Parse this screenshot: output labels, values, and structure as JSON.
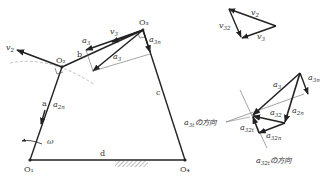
{
  "mechanism": {
    "points": {
      "O1": "O₁",
      "O2": "O₂",
      "O3": "O₃",
      "O4": "O₄"
    },
    "links": {
      "a": "a",
      "b": "b",
      "c": "c",
      "d": "d"
    },
    "angular_velocity": "ω",
    "vectors": {
      "v2": "v",
      "v2_sub": "2",
      "v3": "v",
      "v3_sub": "3",
      "a2n": "a",
      "a2n_sub": "2n",
      "a3": "a",
      "a3_sub": "3",
      "a3n": "a",
      "a3n_sub": "3n",
      "a1": "a",
      "a1_sub": "3"
    }
  },
  "velocity_polygon": {
    "v2": "v",
    "v2_sub": "2",
    "v3": "v",
    "v3_sub": "3",
    "v32": "v",
    "v32_sub": "32"
  },
  "acceleration_polygon": {
    "a3": "a",
    "a3_sub": "3",
    "a3n": "a",
    "a3n_sub": "3n",
    "a2n": "a",
    "a2n_sub": "2n",
    "a32": "a",
    "a32_sub": "32",
    "a32t": "a",
    "a32t_sub": "32t",
    "a32n": "a",
    "a32n_sub": "32n",
    "a3t_dir_label": "a",
    "a3t_dir_sub": "3t",
    "a3t_dir_text": "の方向",
    "a32t_dir_label": "a",
    "a32t_dir_sub": "32t",
    "a32t_dir_text": "の方向"
  }
}
